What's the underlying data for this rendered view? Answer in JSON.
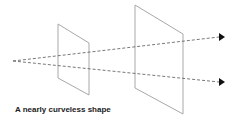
{
  "diagram": {
    "caption": "A nearly curveless shape",
    "colors": {
      "plane_stroke": "#a8a8a8",
      "ray_stroke": "#555555",
      "arrowhead": "#111111",
      "caption": "#222222"
    },
    "origin": {
      "x": 13,
      "y": 61
    },
    "planes": [
      {
        "name": "near-plane",
        "points": "58,24 89,43 89,95 58,78"
      },
      {
        "name": "far-plane",
        "points": "135,5 183,34 183,114 135,88"
      }
    ],
    "rays": [
      {
        "name": "upper-ray",
        "end": {
          "x": 222,
          "y": 37
        }
      },
      {
        "name": "lower-ray",
        "end": {
          "x": 222,
          "y": 82
        }
      }
    ]
  }
}
